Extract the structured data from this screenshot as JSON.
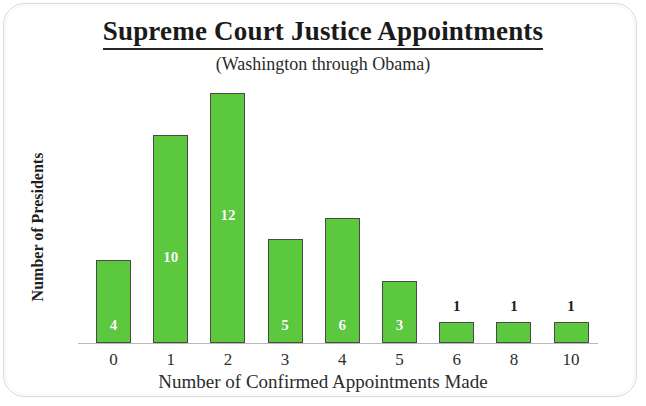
{
  "chart_data": {
    "type": "bar",
    "title": "Supreme Court Justice Appointments",
    "subtitle": "(Washington through Obama)",
    "xlabel": "Number of Confirmed Appointments Made",
    "ylabel": "Number of Presidents",
    "categories": [
      "0",
      "1",
      "2",
      "3",
      "4",
      "5",
      "6",
      "8",
      "10"
    ],
    "values": [
      4,
      10,
      12,
      5,
      6,
      3,
      1,
      1,
      1
    ],
    "value_labels": [
      "4",
      "10",
      "12",
      "5",
      "6",
      "3",
      "1",
      "1",
      "1"
    ],
    "label_placement": [
      "inside",
      "inside",
      "inside",
      "inside",
      "inside",
      "inside",
      "above",
      "above",
      "above"
    ],
    "ylim": [
      0,
      12
    ],
    "grid": false,
    "legend": null,
    "bar_color": "#5bc83e",
    "bar_outline_color": "#4a4a4a",
    "inside_label_color": "#ffffff",
    "above_label_color": "#1a1a1a",
    "axis_color": "#b9b9b9"
  }
}
